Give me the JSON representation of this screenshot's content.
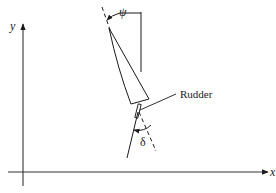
{
  "diagram": {
    "type": "ship-steering-geometry",
    "axes": {
      "x_label": "x",
      "y_label": "y"
    },
    "angles": {
      "heading_label": "ψ",
      "rudder_label": "δ"
    },
    "callouts": {
      "rudder": "Rudder"
    },
    "colors": {
      "stroke": "#1a1a1a",
      "background": "#ffffff"
    }
  }
}
